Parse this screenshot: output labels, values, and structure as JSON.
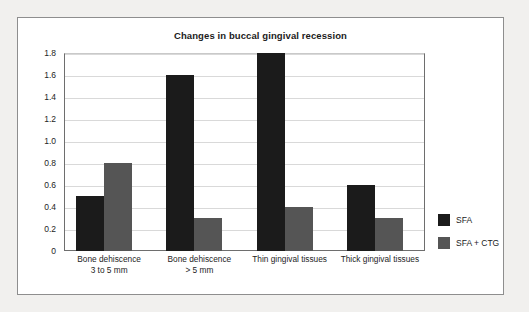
{
  "chart_data": {
    "type": "bar",
    "title": "Changes in buccal gingival recession",
    "xlabel": "",
    "ylabel": "",
    "ylim": [
      0,
      1.8
    ],
    "grid": true,
    "legend_position": "right",
    "categories": [
      "Bone dehiscence\n3 to 5 mm",
      "Bone dehiscence\n> 5 mm",
      "Thin gingival tissues",
      "Thick gingival tissues"
    ],
    "category_lines": [
      [
        "Bone dehiscence",
        "3 to 5 mm"
      ],
      [
        "Bone dehiscence",
        "> 5 mm"
      ],
      [
        "Thin gingival tissues",
        ""
      ],
      [
        "Thick gingival tissues",
        ""
      ]
    ],
    "series": [
      {
        "name": "SFA",
        "color": "#1b1b1b",
        "values": [
          0.5,
          1.6,
          1.8,
          0.6
        ]
      },
      {
        "name": "SFA + CTG",
        "color": "#555555",
        "values": [
          0.8,
          0.3,
          0.4,
          0.3
        ]
      }
    ],
    "ytick_labels": [
      "1.8",
      "1.6",
      "1.4",
      "1.2",
      "1.0",
      "0.8",
      "0.6",
      "0.4",
      "0.2",
      "0"
    ],
    "ytick_values": [
      1.8,
      1.6,
      1.4,
      1.2,
      1.0,
      0.8,
      0.6,
      0.4,
      0.2,
      0
    ]
  },
  "legend": {
    "items": [
      {
        "label": "SFA",
        "color": "#1b1b1b"
      },
      {
        "label": "SFA + CTG",
        "color": "#555555"
      }
    ]
  },
  "colors": {
    "page_background": "#f1f0ee",
    "panel_background": "#ffffff",
    "panel_border": "#8e8e8e",
    "gridline": "#d9d9d9",
    "axis": "#6e6e6e",
    "text": "#1b1b1b"
  }
}
